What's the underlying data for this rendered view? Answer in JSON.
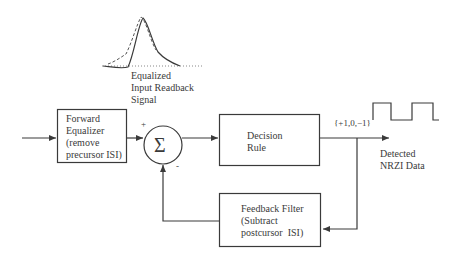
{
  "diagram": {
    "signal_label": [
      "Equalized",
      "Input Readback",
      "Signal"
    ],
    "blocks": {
      "forward_equalizer": [
        "Forward",
        "Equalizer",
        "(remove",
        "precursor ISI)"
      ],
      "decision_rule": [
        "Decision",
        "Rule"
      ],
      "feedback_filter": [
        "Feedback Filter",
        "(Subtract",
        "postcursor  ISI)"
      ]
    },
    "summer": {
      "symbol": "Σ",
      "plus_sign": "+",
      "minus_sign": "-"
    },
    "output": {
      "levels_label": "{+1,0,−1}",
      "detected_label": [
        "Detected",
        "NRZI Data"
      ]
    },
    "colors": {
      "line": "#3a3a3a",
      "text": "#3a3a3a",
      "dashed": "#555555",
      "background": "#ffffff"
    }
  }
}
